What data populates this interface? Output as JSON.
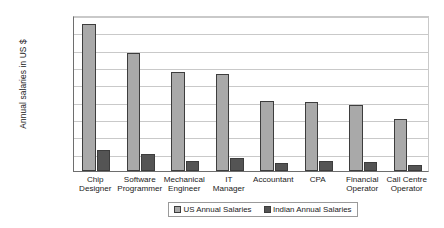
{
  "chart_data": {
    "type": "bar",
    "title": "",
    "xlabel": "",
    "ylabel": "Annual salaries in US $",
    "ylim": [
      0,
      90000
    ],
    "ytick_values": [
      90000,
      80000,
      70000,
      60000,
      50000,
      40000,
      30000,
      20000,
      10000,
      0
    ],
    "ytick_labels": [
      "$90,000",
      "$80,000",
      "$70,000",
      "$60,000",
      "$50,000",
      "$40,000",
      "$30,000",
      "$20,000",
      "$10,000",
      "$-"
    ],
    "grid": true,
    "legend_position": "bottom",
    "categories": [
      "Chip Designer",
      "Software Programmer",
      "Mechanical Engineer",
      "IT Manager",
      "Accountant",
      "CPA",
      "Financial Operator",
      "Call Centre Operator"
    ],
    "category_lines": [
      [
        "Chip",
        "Designer"
      ],
      [
        "Software",
        "Programmer"
      ],
      [
        "Mechanical",
        "Engineer"
      ],
      [
        "IT",
        "Manager"
      ],
      [
        "Accountant",
        ""
      ],
      [
        "CPA",
        ""
      ],
      [
        "Financial",
        "Operator"
      ],
      [
        "Call Centre",
        "Operator"
      ]
    ],
    "series": [
      {
        "name": "US Annual Salaries",
        "color": "#a9a9a9",
        "values": [
          85000,
          68000,
          57000,
          56000,
          40500,
          40000,
          38000,
          30000
        ]
      },
      {
        "name": "Indian Annual Salaries",
        "color": "#545454",
        "values": [
          12000,
          10000,
          6000,
          7500,
          4500,
          6000,
          5000,
          3500
        ]
      }
    ]
  },
  "legend": {
    "items": [
      {
        "label": "US Annual Salaries"
      },
      {
        "label": "Indian Annual Salaries"
      }
    ]
  },
  "colors": {
    "us_bar": "#a9a9a9",
    "india_bar": "#545454",
    "gridline": "#c9c9c9",
    "axis": "#6e6e6e"
  }
}
